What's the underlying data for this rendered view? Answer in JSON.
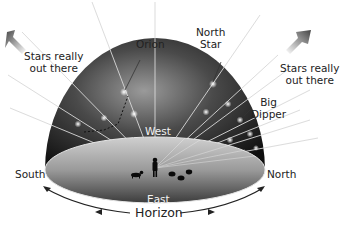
{
  "diagram": {
    "labels": {
      "stars_left": [
        "Stars really",
        "out there"
      ],
      "stars_right": [
        "Stars really",
        "out there"
      ],
      "orion": "Orion",
      "north_star": [
        "North",
        "Star"
      ],
      "big_dipper": [
        "Big",
        "Dipper"
      ],
      "west": "West",
      "east": "East",
      "south": "South",
      "north": "North",
      "horizon": "Horizon"
    },
    "icons": {
      "arrow_left": "arrow-up-left",
      "arrow_right": "arrow-up-right",
      "observer": "person-silhouette",
      "dog": "dog-silhouette",
      "sheep": "sheep-silhouette"
    },
    "colors": {
      "dome_dark": "#1a1a1a",
      "dome_light": "#8a8a8a",
      "floor_light": "#c9c9c9",
      "floor_dark": "#4a4a4a",
      "ray": "#d8d8d8",
      "text": "#222222"
    }
  }
}
